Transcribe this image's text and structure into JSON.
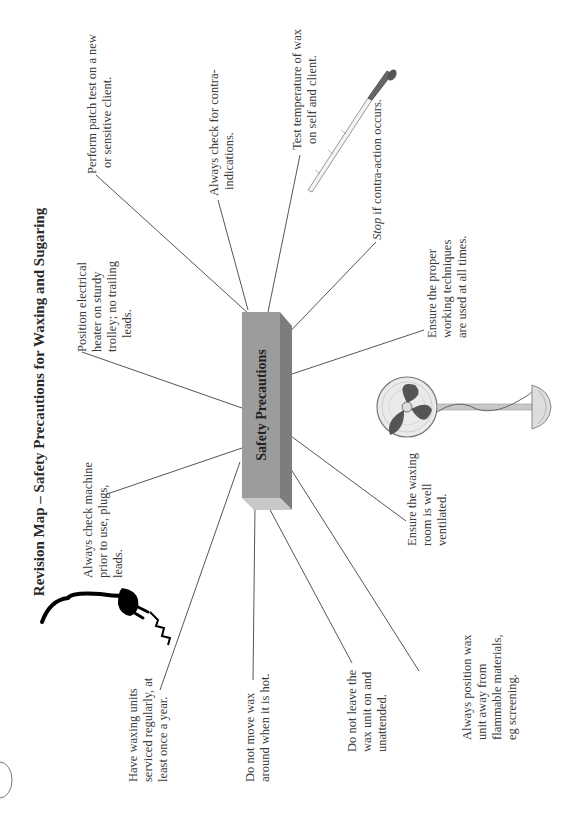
{
  "page": {
    "title": "Revision Map – Safety Precautions for Waxing and Sugaring",
    "orientation": "rotated-90-ccw"
  },
  "center": {
    "label": "Safety Precautions",
    "colors": {
      "front": "#9c9c9c",
      "side": "#7d7d7d",
      "end": "#c8c8c8"
    }
  },
  "notes": [
    {
      "id": "patch-test",
      "lines": [
        "Perform patch test on a new",
        "or sensitive client."
      ]
    },
    {
      "id": "contra-indications",
      "lines": [
        "Always check for contra-",
        "indications."
      ]
    },
    {
      "id": "test-temperature",
      "lines": [
        "Test temperature of wax",
        "on self and client."
      ]
    },
    {
      "id": "stop-contra-action",
      "italic_prefix": "Stop",
      "lines": [
        " if contra-action occurs."
      ]
    },
    {
      "id": "working-techniques",
      "lines": [
        "Ensure the proper",
        "working techniques",
        "are used at all times."
      ]
    },
    {
      "id": "ventilated",
      "lines": [
        "Ensure the waxing",
        "room is well",
        "ventilated."
      ]
    },
    {
      "id": "flammable",
      "lines": [
        "Always position wax",
        "unit away from",
        "flammable materials,",
        "eg screening."
      ]
    },
    {
      "id": "unattended",
      "lines": [
        "Do not leave the",
        "wax unit on and",
        "unattended."
      ]
    },
    {
      "id": "do-not-move",
      "lines": [
        "Do not move wax",
        "around when it is hot."
      ]
    },
    {
      "id": "serviced",
      "lines": [
        "Have waxing units",
        "serviced regularly, at",
        "least once a year."
      ]
    },
    {
      "id": "check-machine",
      "lines": [
        "Always check machine",
        "prior to use, plugs,",
        "leads."
      ]
    },
    {
      "id": "electrical-heater",
      "lines": [
        "Position electrical",
        "heater on sturdy",
        "trolley; no trailing",
        "leads."
      ]
    }
  ],
  "illustrations": [
    {
      "name": "spatula-icon",
      "description": "wax spatula"
    },
    {
      "name": "fan-icon",
      "description": "pedestal fan"
    },
    {
      "name": "plug-icon",
      "description": "electrical plug with spark"
    }
  ]
}
